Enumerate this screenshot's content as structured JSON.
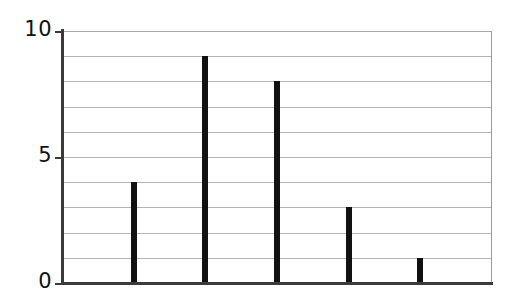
{
  "chart_data": {
    "type": "bar",
    "title": "",
    "subtitle": "",
    "xlabel": "",
    "ylabel": "",
    "categories": [
      "1",
      "2",
      "3",
      "4",
      "5"
    ],
    "values": [
      4,
      9,
      8,
      3,
      1
    ],
    "ylim": [
      0,
      10
    ],
    "y_ticks_labeled": [
      "0",
      "5",
      "10"
    ],
    "y_tick_values_labeled": [
      0,
      5,
      10
    ],
    "y_gridline_values": [
      0,
      1,
      2,
      3,
      4,
      5,
      6,
      7,
      8,
      9,
      10
    ],
    "x_tick_labels": [],
    "grid": "horizontal",
    "legend": "none",
    "annotations": [],
    "colors": {
      "bar": "#111111",
      "grid": "#b4b4b4",
      "axis": "#3a3a3a",
      "background": "#ffffff",
      "text": "#111111"
    }
  }
}
